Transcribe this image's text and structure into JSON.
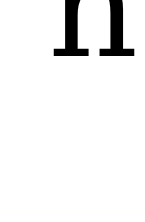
{
  "glyph": {
    "character": "h",
    "color": "#000000"
  },
  "background": "#ffffff"
}
